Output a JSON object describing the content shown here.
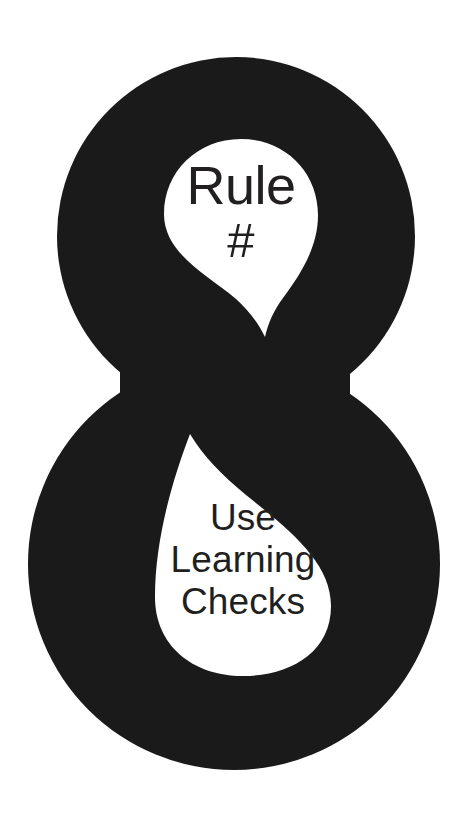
{
  "poster": {
    "background_color": "#ffffff",
    "figure": {
      "name": "numeral-eight",
      "glyph": "8",
      "fill_color": "#1a1a1a",
      "description": "Large solid figure-eight silhouette with two teardrop-shaped white counters"
    },
    "top_counter": {
      "shape": "teardrop",
      "fill_color": "#ffffff",
      "text_color": "#221f20",
      "lines": [
        {
          "text": "Rule",
          "style": "title"
        },
        {
          "text": "#",
          "style": "symbol"
        }
      ]
    },
    "bottom_counter": {
      "shape": "teardrop",
      "fill_color": "#ffffff",
      "text_color": "#221f20",
      "lines": [
        {
          "text": "Use"
        },
        {
          "text": "Learning"
        },
        {
          "text": "Checks"
        }
      ]
    }
  }
}
